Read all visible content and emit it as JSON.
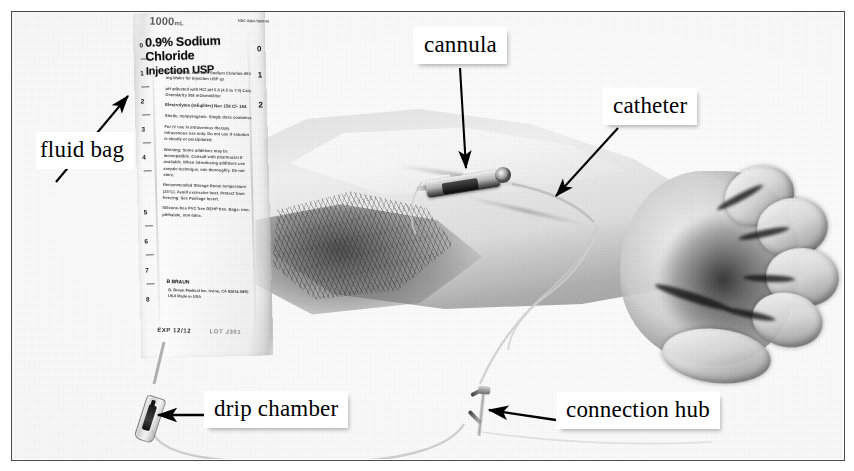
{
  "figure": {
    "border_color": "#4c4c4c",
    "label_text_color": "#000000",
    "label_background": "#ffffff"
  },
  "labels": [
    {
      "id": "fluid-bag",
      "text": "fluid bag",
      "arrow": "diagonal-up-right"
    },
    {
      "id": "cannula",
      "text": "cannula",
      "arrow": "down"
    },
    {
      "id": "catheter",
      "text": "catheter",
      "arrow": "diagonal-down-left"
    },
    {
      "id": "drip-chamber",
      "text": "drip chamber",
      "arrow": "left"
    },
    {
      "id": "connection-hub",
      "text": "connection hub",
      "arrow": "left"
    }
  ],
  "fluid_bag_print": {
    "volume": "1000",
    "volume_unit": "mL",
    "product_name": "0.9% Sodium Chloride",
    "product_sub": "Injection USP",
    "brand": "B BRAUN",
    "brand_sub": "B. Braun Medical Inc. Irvine, CA 92614-5895 USA Made in USA",
    "expiry_label": "EXP",
    "expiry_value": "12/12",
    "lot_code": "LOT J301",
    "corner_code": "NDC 0264-7800-00",
    "body_text_1": "Each 100 mL contains Sodium Chloride 900 mg Water for Injection USP qs",
    "body_text_2": "pH adjusted with HCl pH 5.6 (4.5 to 7.0) Calc. Osmolarity 308 mOsmol/liter",
    "body_text_3": "Electrolytes (mEq/liter) Na+ 154 Cl- 154",
    "body_text_4": "Sterile, nonpyrogenic. Single dose container.",
    "body_text_5": "For IV use in intravenous therapy. Intravenous use only. Do not use if solution is cloudy or precipitated.",
    "body_text_6": "Warning: Some additives may be incompatible. Consult with pharmacist if available. When introducing additives use aseptic technique, mix thoroughly. Do not store.",
    "body_text_7": "Recommended Storage Room temperature (25°C). Avoid excessive heat. Protect from freezing. See Package Insert.",
    "body_text_8": "Rx only",
    "body_text_9": "Silicone-free PVC free DEHP free. Bags: non-phthalate, non-latex.",
    "graduations_left": [
      "0",
      "1",
      "2",
      "3",
      "4",
      "5",
      "6",
      "7",
      "8"
    ],
    "graduations_right": [
      "0",
      "1",
      "2"
    ]
  },
  "scene": {
    "parts": [
      {
        "name": "fluid-bag",
        "description": "IV bag of 0.9% sodium chloride hanging at left"
      },
      {
        "name": "drip-chamber",
        "description": "drip chamber below the fluid bag"
      },
      {
        "name": "iv-tubing",
        "description": "clear IV administration tubing"
      },
      {
        "name": "connection-hub",
        "description": "luer connection hub on the tubing"
      },
      {
        "name": "cannula",
        "description": "cannula taped on the forearm"
      },
      {
        "name": "catheter",
        "description": "catheter tubing running over the wrist"
      },
      {
        "name": "forearm",
        "description": "patient's forearm, palm up"
      },
      {
        "name": "hand",
        "description": "relaxed hand with curled fingers"
      }
    ]
  }
}
